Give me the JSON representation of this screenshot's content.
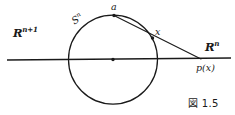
{
  "figure": {
    "caption": "図 1.5",
    "background_color": "#ffffff",
    "ink_color": "#1a1a1a",
    "labels": {
      "ambient_space": {
        "base": "R",
        "exponent": "n+1"
      },
      "sphere": {
        "base": "S",
        "exponent": "n"
      },
      "north_pole": "a",
      "sphere_point": "x",
      "hyperplane": {
        "base": "R",
        "exponent": "n"
      },
      "projected_point": "p(x)"
    },
    "geometry": {
      "circle": {
        "cx": 113,
        "cy": 59.5,
        "r": 44.5
      },
      "center_dot": {
        "cx": 113,
        "cy": 59.5,
        "r": 1.6
      },
      "axis_line": {
        "x1": 7,
        "y1": 60,
        "x2": 231,
        "y2": 58
      },
      "north_pole_point": {
        "cx": 114,
        "cy": 15.5,
        "r": 1.6
      },
      "sphere_point": {
        "cx": 152.5,
        "cy": 38,
        "r": 1.6
      },
      "projection_ray": {
        "x1": 114,
        "y1": 15.5,
        "x2": 201,
        "y2": 59
      }
    }
  }
}
